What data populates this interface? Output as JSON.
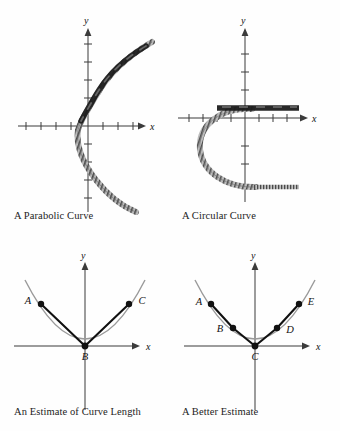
{
  "figure": {
    "title_implicit": "Approximating curve length with line segments",
    "background_color": "#fefefe",
    "ink_color": "#1a1a1a",
    "curve_color": "#8a8a8a",
    "segment_color": "#111111",
    "axis_color": "#3b3b3b"
  },
  "panels": [
    {
      "id": "parabolic",
      "caption": "A Parabolic Curve",
      "axis_x_label": "x",
      "axis_y_label": "y",
      "x_ticks": [
        -4,
        -3,
        -2,
        -1,
        1,
        2,
        3,
        4
      ],
      "y_ticks": [
        -4,
        -3,
        -2,
        -1,
        1,
        2,
        3,
        4
      ],
      "curve_type": "parabola-sideways",
      "curve_description": "Sideways parabola opening right, vertex near (-1.2, 0), hatched band texture",
      "overlay_description": "Thick dark band along the upper-right arm",
      "origin_px": [
        88,
        118
      ]
    },
    {
      "id": "circular",
      "caption": "A Circular Curve",
      "axis_x_label": "x",
      "axis_y_label": "y",
      "x_ticks": [
        -4,
        -3,
        -2,
        -1,
        1,
        2,
        3,
        4
      ],
      "y_ticks": [
        -3,
        -2,
        -1,
        1,
        2,
        3
      ],
      "curve_type": "semicircle-open-right",
      "curve_description": "Hatched semicircle opening to the right with horizontal tails top and bottom",
      "overlay_description": "Thick dark horizontal band along the upper tail",
      "origin_px": [
        75,
        110
      ]
    },
    {
      "id": "estimate",
      "caption": "An Estimate of Curve Length",
      "axis_x_label": "x",
      "axis_y_label": "y",
      "curve_type": "parabola-up",
      "points": [
        {
          "label": "A",
          "label_side": "left",
          "x": -2.0,
          "y": 2.0
        },
        {
          "label": "B",
          "label_side": "below",
          "x": 0.0,
          "y": 0.0
        },
        {
          "label": "C",
          "label_side": "right",
          "x": 2.0,
          "y": 2.0
        }
      ],
      "segments": [
        [
          "A",
          "B"
        ],
        [
          "B",
          "C"
        ]
      ],
      "origin_px": [
        85,
        96
      ]
    },
    {
      "id": "better",
      "caption": "A Better Estimate",
      "axis_x_label": "x",
      "axis_y_label": "y",
      "curve_type": "parabola-up",
      "points": [
        {
          "label": "A",
          "label_side": "left",
          "x": -2.0,
          "y": 2.0
        },
        {
          "label": "B",
          "label_side": "left",
          "x": -1.0,
          "y": 0.55
        },
        {
          "label": "C",
          "label_side": "below",
          "x": 0.0,
          "y": 0.0
        },
        {
          "label": "D",
          "label_side": "right",
          "x": 1.0,
          "y": 0.55
        },
        {
          "label": "E",
          "label_side": "right",
          "x": 2.0,
          "y": 2.0
        }
      ],
      "segments": [
        [
          "A",
          "B"
        ],
        [
          "B",
          "C"
        ],
        [
          "C",
          "D"
        ],
        [
          "D",
          "E"
        ]
      ],
      "origin_px": [
        85,
        96
      ]
    }
  ]
}
